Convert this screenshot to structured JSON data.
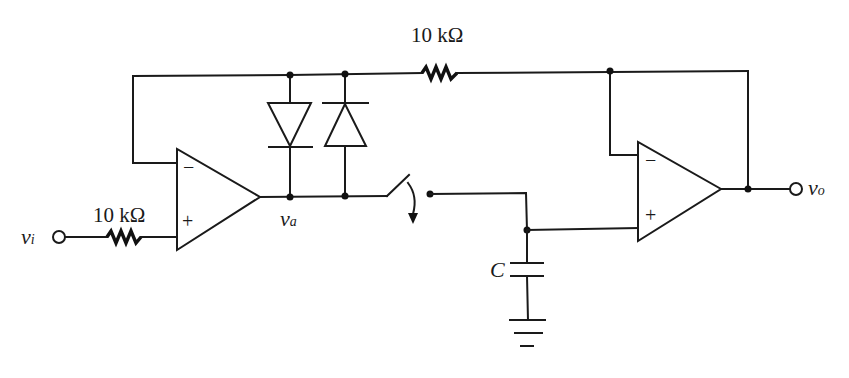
{
  "diagram": {
    "type": "circuit-schematic",
    "components": {
      "r_in": {
        "label": "10 kΩ"
      },
      "r_fb": {
        "label": "10 kΩ"
      },
      "cap": {
        "label": "C"
      },
      "opamp1": {
        "minus": "−",
        "plus": "+"
      },
      "opamp2": {
        "minus": "−",
        "plus": "+"
      }
    },
    "nodes": {
      "input": {
        "symbol": "v",
        "subscript": "i"
      },
      "va": {
        "symbol": "v",
        "subscript": "a"
      },
      "output": {
        "symbol": "v",
        "subscript": "o"
      }
    }
  }
}
